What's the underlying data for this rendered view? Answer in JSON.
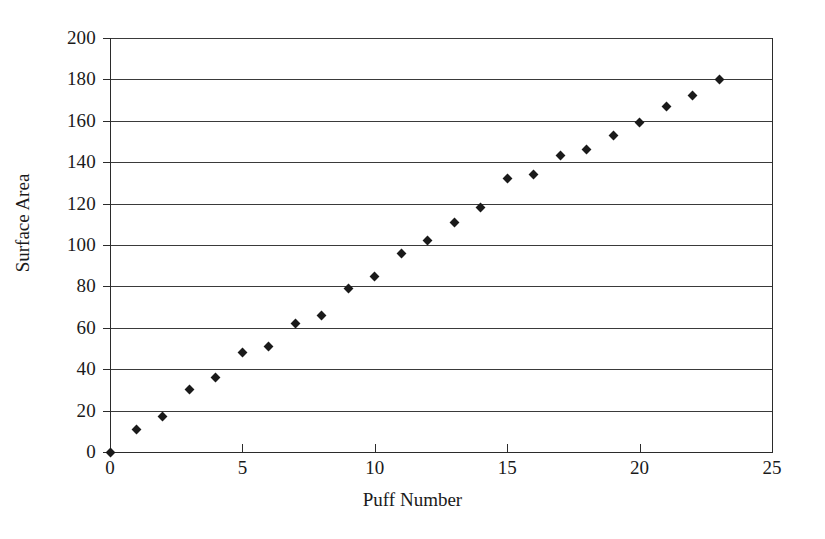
{
  "chart_data": {
    "type": "scatter",
    "title": "",
    "xlabel": "Puff Number",
    "ylabel": "Surface Area",
    "xlim": [
      0,
      25
    ],
    "ylim": [
      0,
      200
    ],
    "xticks": [
      "0",
      "5",
      "10",
      "15",
      "20",
      "25"
    ],
    "xtick_values": [
      0,
      5,
      10,
      15,
      20,
      25
    ],
    "yticks": [
      "0",
      "20",
      "40",
      "60",
      "80",
      "100",
      "120",
      "140",
      "160",
      "180",
      "200"
    ],
    "ytick_values": [
      0,
      20,
      40,
      60,
      80,
      100,
      120,
      140,
      160,
      180,
      200
    ],
    "grid": "horizontal",
    "legend": "none",
    "marker": "diamond",
    "marker_color": "#1a1a1a",
    "x": [
      1,
      2,
      3,
      4,
      5,
      6,
      7,
      8,
      9,
      10,
      11,
      12,
      13,
      14,
      15,
      16,
      17,
      18,
      19,
      20,
      21,
      22,
      23
    ],
    "values": [
      11,
      17,
      30,
      36,
      48,
      51,
      62,
      66,
      79,
      85,
      96,
      102,
      111,
      118,
      132,
      134,
      143,
      146,
      153,
      159,
      167,
      172,
      180
    ]
  },
  "axis_title_x": "Puff Number",
  "axis_title_y": "Surface Area"
}
